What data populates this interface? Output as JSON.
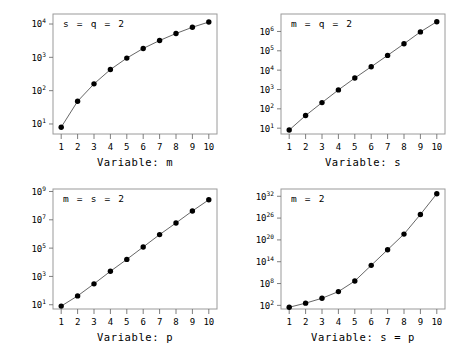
{
  "figure": {
    "background_color": "#ffffff",
    "frame_color": "#9a9a9a",
    "marker_color": "#000000",
    "line_color": "#555555",
    "panel_count": 4
  },
  "chart_data": [
    {
      "type": "line",
      "title": "",
      "annotation": "s = q = 2",
      "xlabel": "Variable: m",
      "ylabel": "",
      "yscale": "log",
      "grid": false,
      "legend": "none",
      "x": [
        1,
        2,
        3,
        4,
        5,
        6,
        7,
        8,
        9,
        10
      ],
      "values": [
        8,
        48,
        160,
        430,
        950,
        1850,
        3200,
        5200,
        8000,
        11500
      ],
      "xlim": [
        0.5,
        10.5
      ],
      "ylim": [
        5,
        20000
      ],
      "xticks": [
        "1",
        "2",
        "3",
        "4",
        "5",
        "6",
        "7",
        "8",
        "9",
        "10"
      ],
      "yticks": [
        {
          "base": "10",
          "exp": "1"
        },
        {
          "base": "10",
          "exp": "2"
        },
        {
          "base": "10",
          "exp": "3"
        },
        {
          "base": "10",
          "exp": "4"
        }
      ],
      "ytick_values": [
        10,
        100,
        1000,
        10000
      ]
    },
    {
      "type": "line",
      "title": "",
      "annotation": "m = q = 2",
      "xlabel": "Variable: s",
      "ylabel": "",
      "yscale": "log",
      "grid": false,
      "legend": "none",
      "x": [
        1,
        2,
        3,
        4,
        5,
        6,
        7,
        8,
        9,
        10
      ],
      "values": [
        8,
        45,
        210,
        950,
        3900,
        15000,
        58000,
        230000,
        950000,
        3200000
      ],
      "xlim": [
        0.5,
        10.5
      ],
      "ylim": [
        5,
        8000000
      ],
      "xticks": [
        "1",
        "2",
        "3",
        "4",
        "5",
        "6",
        "7",
        "8",
        "9",
        "10"
      ],
      "yticks": [
        {
          "base": "10",
          "exp": "1"
        },
        {
          "base": "10",
          "exp": "2"
        },
        {
          "base": "10",
          "exp": "3"
        },
        {
          "base": "10",
          "exp": "4"
        },
        {
          "base": "10",
          "exp": "5"
        },
        {
          "base": "10",
          "exp": "6"
        }
      ],
      "ytick_values": [
        10,
        100,
        1000,
        10000,
        100000,
        1000000
      ]
    },
    {
      "type": "line",
      "title": "",
      "annotation": "m = s = 2",
      "xlabel": "Variable: p",
      "ylabel": "",
      "yscale": "log",
      "grid": false,
      "legend": "none",
      "x": [
        1,
        2,
        3,
        4,
        5,
        6,
        7,
        8,
        9,
        10
      ],
      "values": [
        8,
        42,
        300,
        2300,
        16000,
        120000,
        900000,
        6000000,
        42000000,
        260000000
      ],
      "xlim": [
        0.5,
        10.5
      ],
      "ylim": [
        5,
        1500000000
      ],
      "xticks": [
        "1",
        "2",
        "3",
        "4",
        "5",
        "6",
        "7",
        "8",
        "9",
        "10"
      ],
      "yticks": [
        {
          "base": "10",
          "exp": "1"
        },
        {
          "base": "10",
          "exp": "3"
        },
        {
          "base": "10",
          "exp": "5"
        },
        {
          "base": "10",
          "exp": "7"
        },
        {
          "base": "10",
          "exp": "9"
        }
      ],
      "ytick_values": [
        10,
        1000,
        100000,
        10000000,
        1000000000
      ]
    },
    {
      "type": "line",
      "title": "",
      "annotation": "m = 2",
      "xlabel": "Variable: s = p",
      "ylabel": "",
      "yscale": "log",
      "grid": false,
      "legend": "none",
      "x": [
        1,
        2,
        3,
        4,
        5,
        6,
        7,
        8,
        9,
        10
      ],
      "values": [
        30,
        400,
        9000,
        600000,
        500000000,
        10000000000000.0,
        2e+17,
        4e+21,
        1e+27,
        5e+32
      ],
      "xlim": [
        0.5,
        10.5
      ],
      "ylim": [
        10,
        1e+34
      ],
      "xticks": [
        "1",
        "2",
        "3",
        "4",
        "5",
        "6",
        "7",
        "8",
        "9",
        "10"
      ],
      "yticks": [
        {
          "base": "10",
          "exp": "2"
        },
        {
          "base": "10",
          "exp": "8"
        },
        {
          "base": "10",
          "exp": "14"
        },
        {
          "base": "10",
          "exp": "20"
        },
        {
          "base": "10",
          "exp": "26"
        },
        {
          "base": "10",
          "exp": "32"
        }
      ],
      "ytick_values": [
        100,
        100000000,
        100000000000000.0,
        1e+20,
        1e+26,
        1e+32
      ]
    }
  ]
}
